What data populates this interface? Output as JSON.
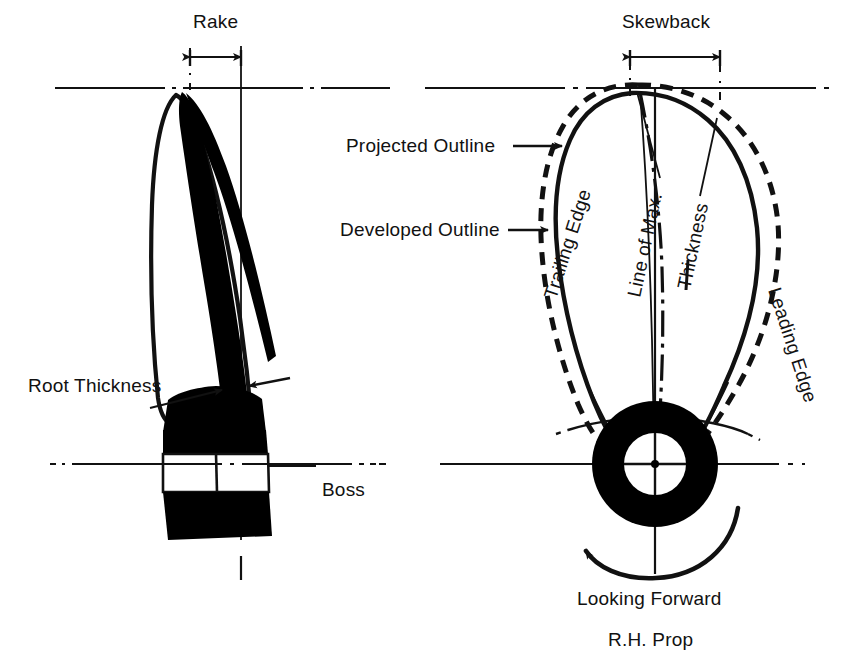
{
  "figure": {
    "title_implied": "Propeller blade geometry definitions",
    "views": [
      {
        "name": "side-elevation",
        "side": "left"
      },
      {
        "name": "projected-view",
        "side": "right"
      }
    ]
  },
  "labels": {
    "rake": "Rake",
    "skewback": "Skewback",
    "projected_outline": "Projected Outline",
    "developed_outline": "Developed Outline",
    "root_thickness": "Root Thickness",
    "boss": "Boss",
    "trailing_edge": "Trailing Edge",
    "leading_edge": "Leading Edge",
    "line_of_max": "Line of Max.",
    "thickness": "Thickness",
    "looking_forward": "Looking Forward",
    "rh_prop": "R.H. Prop"
  },
  "colors": {
    "ink": "#111111",
    "fill": "#000000",
    "paper": "#ffffff"
  },
  "strokes": {
    "centerline_dash": "34 5 3 5",
    "outline_dash": "13 9"
  }
}
